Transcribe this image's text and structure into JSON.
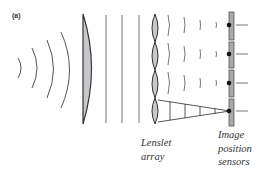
{
  "figure": {
    "panel_label": "(a)",
    "captions": {
      "lenslet": [
        "Lenslet",
        "array"
      ],
      "sensors": [
        "Image",
        "position",
        "sensors"
      ]
    },
    "colors": {
      "stroke": "#555555",
      "lens_fill": "#c8c8cc",
      "sensor_fill": "#a9a9ad",
      "dot": "#111111"
    },
    "components": [
      "incoming-wavefronts",
      "collimating-lens",
      "plane-wavefronts",
      "lenslet-array",
      "focusing-wavefronts",
      "image-position-sensors"
    ]
  }
}
